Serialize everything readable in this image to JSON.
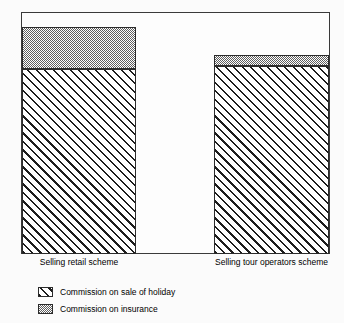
{
  "chart_data": {
    "type": "bar",
    "subtype": "stacked-bar",
    "title": "",
    "subtitle": "",
    "xlabel": "",
    "ylabel": "",
    "categories": [
      "Selling retail scheme",
      "Selling tour operators scheme"
    ],
    "series": [
      {
        "name": "Commission on sale of holiday",
        "pattern": "diagonal-hatch",
        "values": [
          20.0,
          20.3
        ]
      },
      {
        "name": "Commission on insurance",
        "pattern": "grey-dither",
        "values": [
          4.5,
          1.2
        ]
      }
    ],
    "totals": [
      24.5,
      21.5
    ],
    "ylim": [
      0,
      26
    ],
    "ytick_step": 2,
    "yticks": [
      0,
      2,
      4,
      6,
      8,
      10,
      12,
      14,
      16,
      18,
      20,
      22,
      24,
      26
    ],
    "ytick_labels": [
      "0",
      "2",
      "4",
      "6",
      "8",
      "10",
      "12",
      "14",
      "16",
      "18",
      "20",
      "22",
      "24",
      "26"
    ],
    "grid": false,
    "legend_position": "below-left",
    "legend": [
      "Commission on sale of holiday",
      "Commission on insurance"
    ],
    "colors": {
      "background": "#fbfbfb",
      "plot_background": "#fdfdfd",
      "axis": "#3a3a3a",
      "bar_outline": "#2b2b2b",
      "hatch_line": "#1d1d1d",
      "dither_grey": "#5f5f5f",
      "text": "#000000"
    }
  },
  "axis": {
    "x_labels": [
      "Selling retail scheme",
      "Selling tour operators scheme"
    ]
  },
  "legend": {
    "items": [
      {
        "label": "Commission on sale of holiday",
        "swatch": "hatch-swatch"
      },
      {
        "label": "Commission on insurance",
        "swatch": "dither-swatch"
      }
    ]
  }
}
